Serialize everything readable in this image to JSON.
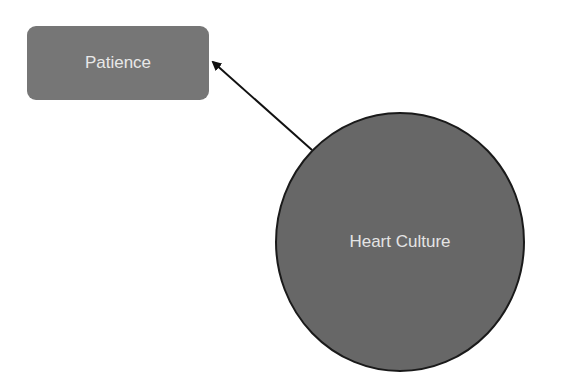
{
  "diagram": {
    "nodes": [
      {
        "id": "patience",
        "label": "Patience",
        "shape": "rounded-rectangle",
        "fill": "#767676"
      },
      {
        "id": "heart_culture",
        "label": "Heart Culture",
        "shape": "circle",
        "fill": "#676767",
        "stroke": "#1a1a1a"
      }
    ],
    "edges": [
      {
        "from": "heart_culture",
        "to": "patience",
        "arrow": "end",
        "color": "#111111"
      }
    ]
  }
}
